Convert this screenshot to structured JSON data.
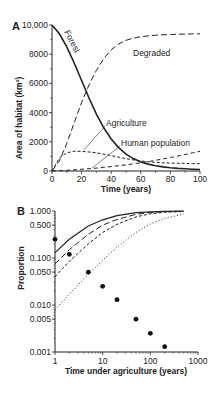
{
  "chart_data": [
    {
      "panel": "A",
      "type": "line",
      "title": "",
      "xlabel": "Time (years)",
      "ylabel": "Area of habitat (km²)",
      "xlim": [
        0,
        100
      ],
      "ylim": [
        0,
        10000
      ],
      "xticks": [
        "0",
        "20",
        "40",
        "60",
        "80",
        "100"
      ],
      "yticks": [
        "0",
        "2000",
        "4000",
        "6000",
        "8000",
        "10,000"
      ],
      "grid": false,
      "x": [
        0,
        5,
        10,
        15,
        20,
        25,
        30,
        35,
        40,
        45,
        50,
        55,
        60,
        65,
        70,
        75,
        80,
        85,
        90,
        95,
        100
      ],
      "series": [
        {
          "name": "Forest",
          "style": "solid",
          "values": [
            10000,
            9400,
            8500,
            7400,
            6200,
            5000,
            3900,
            2950,
            2200,
            1600,
            1150,
            850,
            620,
            470,
            360,
            280,
            220,
            180,
            150,
            120,
            100
          ]
        },
        {
          "name": "Degraded",
          "style": "long-dash",
          "values": [
            0,
            700,
            1900,
            3300,
            4700,
            5900,
            6900,
            7700,
            8300,
            8700,
            8950,
            9100,
            9200,
            9250,
            9300,
            9330,
            9350,
            9370,
            9380,
            9390,
            9400
          ]
        },
        {
          "name": "Agriculture",
          "style": "short-dash",
          "values": [
            0,
            900,
            1250,
            1350,
            1350,
            1300,
            1250,
            1150,
            1050,
            950,
            850,
            760,
            690,
            630,
            590,
            560,
            540,
            530,
            520,
            510,
            500
          ]
        },
        {
          "name": "Human population",
          "style": "dash",
          "values": [
            0,
            20,
            50,
            80,
            120,
            160,
            200,
            250,
            300,
            360,
            420,
            490,
            560,
            640,
            730,
            820,
            920,
            1030,
            1140,
            1250,
            1350
          ]
        }
      ],
      "annotations": [
        "Forest",
        "Degraded",
        "Agriculture",
        "Human population"
      ]
    },
    {
      "panel": "B",
      "type": "line",
      "title": "",
      "xlabel": "Time under agriculture (years)",
      "ylabel": "Proportion",
      "xscale": "log",
      "yscale": "log",
      "xlim": [
        1,
        1000
      ],
      "ylim": [
        0.001,
        1.0
      ],
      "xticks": [
        "1",
        "10",
        "100",
        "1000"
      ],
      "yticks": [
        "0.001",
        "0.005",
        "0.010",
        "0.050",
        "0.100",
        "0.500",
        "1.000"
      ],
      "grid": false,
      "x": [
        1,
        2,
        5,
        10,
        20,
        50,
        100,
        200,
        500
      ],
      "series": [
        {
          "name": "curve 1",
          "style": "solid",
          "values": [
            0.13,
            0.25,
            0.48,
            0.65,
            0.8,
            0.92,
            0.96,
            0.98,
            0.99
          ]
        },
        {
          "name": "curve 2",
          "style": "long-dash",
          "values": [
            0.075,
            0.15,
            0.32,
            0.5,
            0.66,
            0.85,
            0.93,
            0.97,
            0.99
          ]
        },
        {
          "name": "curve 3",
          "style": "short-dash",
          "values": [
            0.04,
            0.085,
            0.2,
            0.35,
            0.52,
            0.75,
            0.87,
            0.94,
            0.98
          ]
        },
        {
          "name": "curve 4",
          "style": "dotted",
          "values": [
            0.008,
            0.017,
            0.045,
            0.09,
            0.17,
            0.35,
            0.53,
            0.7,
            0.86
          ]
        },
        {
          "name": "observed",
          "style": "points",
          "x": [
            1,
            2,
            5,
            10,
            20,
            50,
            100,
            200
          ],
          "values": [
            0.25,
            0.12,
            0.05,
            0.025,
            0.013,
            0.005,
            0.0025,
            0.0013
          ]
        }
      ]
    }
  ],
  "labels": {
    "panel_a": "A",
    "panel_b": "B",
    "a_xlabel": "Time (years)",
    "a_ylabel": "Area of habitat (km²)",
    "b_xlabel": "Time under agriculture (years)",
    "b_ylabel": "Proportion",
    "forest": "Forest",
    "degraded": "Degraded",
    "agriculture": "Agriculture",
    "human_population": "Human population",
    "a_yticks": [
      "0",
      "2000",
      "4000",
      "6000",
      "8000",
      "10,000"
    ],
    "a_xticks": [
      "0",
      "20",
      "40",
      "60",
      "80",
      "100"
    ],
    "b_yticks": [
      "1.000",
      "0.500",
      "0.100",
      "0.050",
      "0.010",
      "0.005",
      "0.001"
    ],
    "b_xticks": [
      "1",
      "10",
      "100",
      "1000"
    ]
  }
}
